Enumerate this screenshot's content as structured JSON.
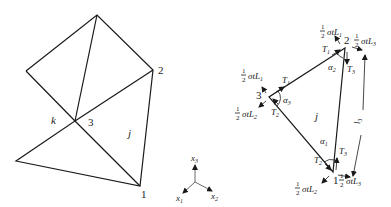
{
  "figure": {
    "left_mesh": {
      "node_labels": {
        "n1": "1",
        "n2": "2",
        "n3": "3"
      },
      "element_labels": {
        "k": "k",
        "j": "j"
      }
    },
    "axes": {
      "x1": "x",
      "x1_sub": "1",
      "x2": "x",
      "x2_sub": "2",
      "x3": "x",
      "x3_sub": "3"
    },
    "element": {
      "label": "j",
      "nodes": {
        "n1": "1",
        "n2": "2",
        "n3": "3"
      },
      "angles": {
        "a1": "α",
        "a1_sub": "1",
        "a2": "α",
        "a2_sub": "2",
        "a3": "α",
        "a3_sub": "3"
      },
      "tensions": {
        "T1": "T",
        "T1_sub": "1",
        "T2": "T",
        "T2_sub": "2",
        "T3": "T",
        "T3_sub": "3"
      },
      "loads": {
        "half_num": "1",
        "half_den": "2",
        "L1": "σtL",
        "L1_sub": "1",
        "L2": "σtL",
        "L2_sub": "2",
        "L3": "σtL",
        "L3_sub": "3"
      },
      "length_label": "l",
      "length_sub": "3"
    }
  }
}
